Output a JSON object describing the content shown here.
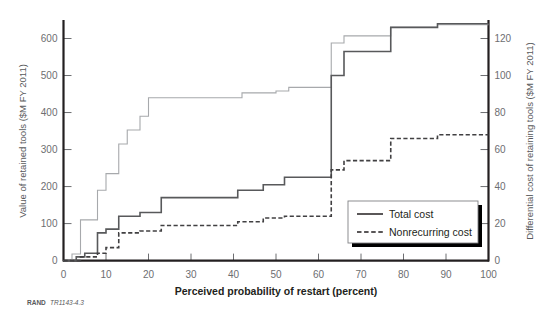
{
  "figure": {
    "source_prefix": "RAND",
    "source_id": "TR1143-4.3"
  },
  "chart_data": {
    "type": "line",
    "title": "",
    "xlabel": "Perceived probability of restart (percent)",
    "ylabel": "Value of retained tools ($M FY 2011)",
    "y2label": "Differential cost of retaining tools ($M FY 2011)",
    "xlim": [
      0,
      100
    ],
    "ylim": [
      0,
      650
    ],
    "y2lim": [
      0,
      130
    ],
    "xticks": [
      0,
      10,
      20,
      30,
      40,
      50,
      60,
      70,
      80,
      90,
      100
    ],
    "yticks": [
      0,
      100,
      200,
      300,
      400,
      500,
      600
    ],
    "y2ticks": [
      0,
      20,
      40,
      60,
      80,
      100,
      120
    ],
    "grid": false,
    "legend_position": "bottom-right",
    "legend": [
      "Total cost",
      "Nonrecurring cost"
    ],
    "colors": {
      "value_retained": "#a7a9ac",
      "total_cost": "#58595b",
      "nonrecurring_cost": "#414042",
      "axis": "#231f20"
    },
    "series": [
      {
        "name": "Value of retained tools",
        "axis": "left",
        "style": "solid",
        "color": "#a7a9ac",
        "steps": [
          [
            0,
            0
          ],
          [
            2,
            0
          ],
          [
            2,
            18
          ],
          [
            4,
            18
          ],
          [
            4,
            110
          ],
          [
            8,
            110
          ],
          [
            8,
            190
          ],
          [
            10,
            190
          ],
          [
            10,
            235
          ],
          [
            13,
            235
          ],
          [
            13,
            315
          ],
          [
            15,
            315
          ],
          [
            15,
            353
          ],
          [
            18,
            353
          ],
          [
            18,
            390
          ],
          [
            20,
            390
          ],
          [
            20,
            440
          ],
          [
            42,
            440
          ],
          [
            42,
            453
          ],
          [
            50,
            453
          ],
          [
            50,
            458
          ],
          [
            53,
            458
          ],
          [
            53,
            468
          ],
          [
            63,
            468
          ],
          [
            63,
            588
          ],
          [
            66,
            588
          ],
          [
            66,
            607
          ],
          [
            77,
            607
          ],
          [
            77,
            630
          ],
          [
            88,
            630
          ],
          [
            88,
            637
          ],
          [
            100,
            637
          ]
        ]
      },
      {
        "name": "Total cost",
        "axis": "right",
        "style": "solid",
        "color": "#58595b",
        "steps": [
          [
            0,
            0
          ],
          [
            3,
            0
          ],
          [
            3,
            2
          ],
          [
            5,
            2
          ],
          [
            5,
            4
          ],
          [
            8,
            4
          ],
          [
            8,
            15
          ],
          [
            10,
            15
          ],
          [
            10,
            17
          ],
          [
            13,
            17
          ],
          [
            13,
            24
          ],
          [
            18,
            24
          ],
          [
            18,
            26
          ],
          [
            23,
            26
          ],
          [
            23,
            34
          ],
          [
            41,
            34
          ],
          [
            41,
            38
          ],
          [
            47,
            38
          ],
          [
            47,
            41
          ],
          [
            52,
            41
          ],
          [
            52,
            45
          ],
          [
            63,
            45
          ],
          [
            63,
            100
          ],
          [
            66,
            100
          ],
          [
            66,
            113
          ],
          [
            77,
            113
          ],
          [
            77,
            126
          ],
          [
            88,
            126
          ],
          [
            88,
            128
          ],
          [
            100,
            128
          ]
        ]
      },
      {
        "name": "Nonrecurring cost",
        "axis": "right",
        "style": "dashed",
        "color": "#414042",
        "steps": [
          [
            0,
            0
          ],
          [
            4,
            0
          ],
          [
            4,
            2
          ],
          [
            8,
            2
          ],
          [
            8,
            4
          ],
          [
            10,
            4
          ],
          [
            10,
            7
          ],
          [
            13,
            7
          ],
          [
            13,
            15
          ],
          [
            18,
            15
          ],
          [
            18,
            16
          ],
          [
            23,
            16
          ],
          [
            23,
            19
          ],
          [
            41,
            19
          ],
          [
            41,
            21
          ],
          [
            47,
            21
          ],
          [
            47,
            23
          ],
          [
            52,
            23
          ],
          [
            52,
            24
          ],
          [
            63,
            24
          ],
          [
            63,
            49
          ],
          [
            66,
            49
          ],
          [
            66,
            54
          ],
          [
            77,
            54
          ],
          [
            77,
            66
          ],
          [
            88,
            66
          ],
          [
            88,
            68
          ],
          [
            100,
            68
          ]
        ]
      }
    ]
  }
}
